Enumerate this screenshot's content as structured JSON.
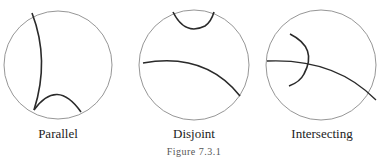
{
  "panels": [
    {
      "label": "Parallel"
    },
    {
      "label": "Disjoint"
    },
    {
      "label": "Intersecting"
    }
  ],
  "caption": "Figure 7.3.1",
  "colors": {
    "disk_outline": "#8a8a8a",
    "geodesic": "#2a2a2a",
    "text": "#222222"
  }
}
